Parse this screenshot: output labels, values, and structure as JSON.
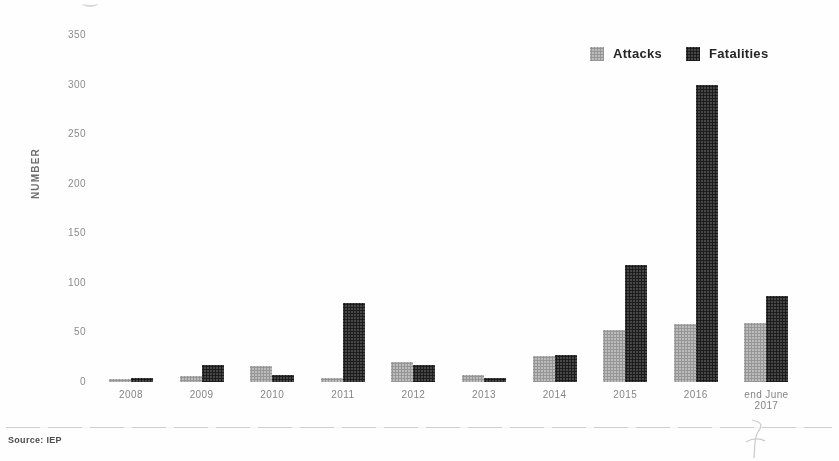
{
  "chart_data": {
    "type": "bar",
    "title": "",
    "categories": [
      "2008",
      "2009",
      "2010",
      "2011",
      "2012",
      "2013",
      "2014",
      "2015",
      "2016",
      "end June 2017"
    ],
    "series": [
      {
        "name": "Attacks",
        "color": "#bcbcbc",
        "values": [
          3,
          6,
          16,
          4,
          20,
          7,
          26,
          52,
          58,
          60
        ]
      },
      {
        "name": "Fatalities",
        "color": "#383838",
        "values": [
          4,
          17,
          7,
          80,
          17,
          4,
          27,
          118,
          300,
          87
        ]
      }
    ],
    "xlabel": "",
    "ylabel": "NUMBER",
    "ylim": [
      0,
      350
    ],
    "yticks": [
      0,
      50,
      100,
      150,
      200,
      250,
      300,
      350
    ],
    "grid": false,
    "legend_position": "top-right"
  },
  "footer": {
    "source": "Source: IEP"
  },
  "colors": {
    "attacks": "#bcbcbc",
    "fatalities": "#383838",
    "background": "#fefefe"
  }
}
